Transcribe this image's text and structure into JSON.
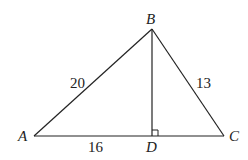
{
  "diagram": {
    "points": {
      "A": {
        "label": "A",
        "x": 34,
        "y": 136
      },
      "B": {
        "label": "B",
        "x": 152,
        "y": 29
      },
      "C": {
        "label": "C",
        "x": 224,
        "y": 136
      },
      "D": {
        "label": "D",
        "x": 152,
        "y": 136
      }
    },
    "segments": [
      {
        "from": "A",
        "to": "B",
        "length_label": "20"
      },
      {
        "from": "B",
        "to": "C",
        "length_label": "13"
      },
      {
        "from": "A",
        "to": "D",
        "length_label": "16"
      },
      {
        "from": "D",
        "to": "C",
        "length_label": ""
      },
      {
        "from": "B",
        "to": "D",
        "length_label": ""
      }
    ],
    "right_angle_at": "D",
    "labels": {
      "AB": "20",
      "BC": "13",
      "AD": "16"
    },
    "colors": {
      "line": "#222222",
      "background": "#ffffff"
    }
  }
}
